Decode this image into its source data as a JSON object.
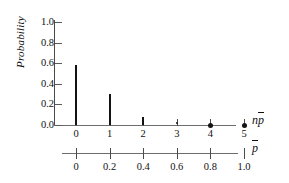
{
  "chart_data": {
    "type": "bar",
    "title": "",
    "xlabel": "np̄",
    "ylabel": "Probability",
    "categories": [
      0,
      1,
      2,
      3,
      4,
      5
    ],
    "values": [
      0.58,
      0.3,
      0.075,
      0.01,
      0.0,
      0.0
    ],
    "ylim": [
      0.0,
      1.0
    ],
    "xlim": [
      0,
      5
    ],
    "grid": false,
    "legend": null,
    "markers": [
      {
        "x": 3,
        "y": 0.01,
        "style": "tiny-dot"
      },
      {
        "x": 4,
        "y": 0.0,
        "style": "dot"
      },
      {
        "x": 5,
        "y": 0.0,
        "style": "dot"
      }
    ],
    "secondary_axis": {
      "label": "p̄",
      "ticks": [
        0,
        0.2,
        0.4,
        0.6,
        0.8,
        1.0
      ],
      "tick_labels": [
        "0",
        "0.2",
        "0.4",
        "0.6",
        "0.8",
        "1.0"
      ]
    }
  },
  "axes": {
    "y": {
      "label": "Probability",
      "ticks": [
        {
          "value": 1.0,
          "label": "1.0"
        },
        {
          "value": 0.8,
          "label": "0.8"
        },
        {
          "value": 0.6,
          "label": "0.6"
        },
        {
          "value": 0.4,
          "label": "0.4"
        },
        {
          "value": 0.2,
          "label": "0.2"
        },
        {
          "value": 0.0,
          "label": "0.0"
        }
      ]
    },
    "x_primary": {
      "label_base": "n",
      "label_var": "p",
      "tick_labels": [
        "0",
        "1",
        "2",
        "3",
        "4",
        "5"
      ]
    },
    "x_secondary": {
      "label_var": "p",
      "tick_labels": [
        "0",
        "0.2",
        "0.4",
        "0.6",
        "0.8",
        "1.0"
      ]
    }
  },
  "colors": {
    "bar": "#131313",
    "axis": "#5a5a5a",
    "background": "#ffffff",
    "text": "#111111"
  }
}
